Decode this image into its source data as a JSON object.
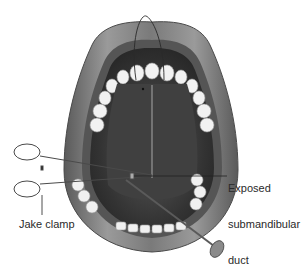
{
  "figure": {
    "style": "grayscale",
    "labels": {
      "duct_line1": "Exposed",
      "duct_line2": "submandibular",
      "duct_line3": "duct",
      "clamp": "Jake clamp"
    },
    "colors": {
      "background": "#ffffff",
      "lip": "#6e6e6e",
      "lip_highlight": "#a8a8a8",
      "cavity": "#3a3a3a",
      "tongue_floor": "#4a4a4a",
      "teeth": "#f2f2f2",
      "instrument": "#5a5a5a",
      "label_text": "#2a2a2a"
    }
  }
}
